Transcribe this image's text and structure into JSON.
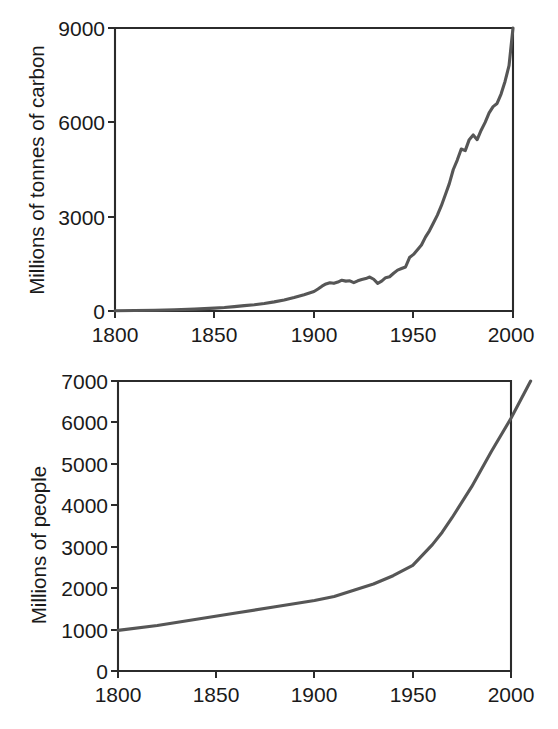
{
  "figure": {
    "background_color": "#ffffff",
    "line_color": "#565656",
    "axis_color": "#2b2b2b"
  },
  "chart_data": [
    {
      "type": "line",
      "name": "carbon-emissions",
      "title": "",
      "xlabel": "",
      "ylabel": "Millions of tonnes of carbon",
      "xlim": [
        1800,
        2000
      ],
      "ylim": [
        0,
        9000
      ],
      "xticks": [
        1800,
        1850,
        1900,
        1950,
        2000
      ],
      "xticklabels": [
        "1800",
        "1850",
        "1900",
        "1950",
        "2000"
      ],
      "yticks": [
        0,
        3000,
        6000,
        9000
      ],
      "yticklabels": [
        "0",
        "3000",
        "6000",
        "9000"
      ],
      "grid": false,
      "legend": "none",
      "x": [
        1800,
        1810,
        1820,
        1830,
        1840,
        1850,
        1855,
        1860,
        1865,
        1870,
        1875,
        1880,
        1885,
        1890,
        1895,
        1900,
        1902,
        1904,
        1906,
        1908,
        1910,
        1912,
        1914,
        1916,
        1918,
        1920,
        1922,
        1924,
        1926,
        1928,
        1930,
        1932,
        1934,
        1936,
        1938,
        1940,
        1942,
        1944,
        1946,
        1948,
        1950,
        1952,
        1954,
        1956,
        1958,
        1960,
        1962,
        1964,
        1966,
        1968,
        1970,
        1972,
        1974,
        1976,
        1978,
        1980,
        1982,
        1984,
        1986,
        1988,
        1990,
        1992,
        1994,
        1996,
        1998,
        2000
      ],
      "values": [
        10,
        15,
        25,
        40,
        60,
        90,
        110,
        140,
        170,
        200,
        240,
        290,
        350,
        430,
        520,
        620,
        700,
        790,
        860,
        900,
        880,
        920,
        980,
        950,
        960,
        900,
        960,
        1000,
        1030,
        1080,
        1010,
        880,
        950,
        1060,
        1090,
        1200,
        1300,
        1350,
        1400,
        1700,
        1800,
        1950,
        2100,
        2350,
        2550,
        2800,
        3050,
        3350,
        3700,
        4050,
        4500,
        4800,
        5150,
        5100,
        5450,
        5600,
        5450,
        5750,
        6000,
        6300,
        6500,
        6600,
        6900,
        7300,
        7800,
        9000
      ]
    },
    {
      "type": "line",
      "name": "world-population",
      "title": "",
      "xlabel": "",
      "ylabel": "Millions of people",
      "xlim": [
        1800,
        2010
      ],
      "ylim": [
        0,
        7000
      ],
      "box_xlim": [
        1800,
        2000
      ],
      "xticks": [
        1800,
        1850,
        1900,
        1950,
        2000
      ],
      "xticklabels": [
        "1800",
        "1850",
        "1900",
        "1950",
        "2000"
      ],
      "yticks": [
        0,
        1000,
        2000,
        3000,
        4000,
        5000,
        6000,
        7000
      ],
      "yticklabels": [
        "0",
        "1000",
        "2000",
        "3000",
        "4000",
        "5000",
        "6000",
        "7000"
      ],
      "grid": false,
      "legend": "none",
      "x": [
        1800,
        1820,
        1840,
        1860,
        1880,
        1900,
        1910,
        1920,
        1930,
        1940,
        1950,
        1960,
        1965,
        1970,
        1980,
        1990,
        2000,
        2010
      ],
      "values": [
        980,
        1100,
        1250,
        1400,
        1550,
        1700,
        1800,
        1950,
        2100,
        2300,
        2550,
        3050,
        3350,
        3700,
        4450,
        5300,
        6100,
        7000
      ]
    }
  ]
}
